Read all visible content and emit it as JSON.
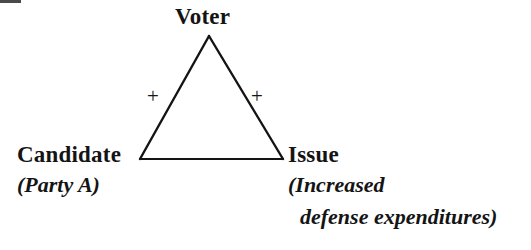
{
  "diagram": {
    "type": "balance-theory-triangle",
    "title": "",
    "background_color": "#ffffff",
    "stroke_color": "#141414",
    "text_color": "#141414",
    "nodes": [
      {
        "id": "voter",
        "label": "Voter",
        "sublabel": "",
        "position": "apex",
        "x": 209,
        "y": 36
      },
      {
        "id": "candidate",
        "label": "Candidate",
        "sublabel": "(Party A)",
        "position": "bottom-left",
        "x": 140,
        "y": 159
      },
      {
        "id": "issue",
        "label": "Issue",
        "sublabel_line1": "(Increased",
        "sublabel_line2": "defense expenditures)",
        "position": "bottom-right",
        "x": 283,
        "y": 159
      }
    ],
    "edges": [
      {
        "id": "voter-candidate",
        "from": "voter",
        "to": "candidate",
        "sign": "+",
        "sign_name": "plus-sign"
      },
      {
        "id": "voter-issue",
        "from": "voter",
        "to": "issue",
        "sign": "+",
        "sign_name": "plus-sign"
      },
      {
        "id": "candidate-issue",
        "from": "candidate",
        "to": "issue",
        "sign": "−",
        "sign_name": "minus-sign"
      }
    ]
  }
}
